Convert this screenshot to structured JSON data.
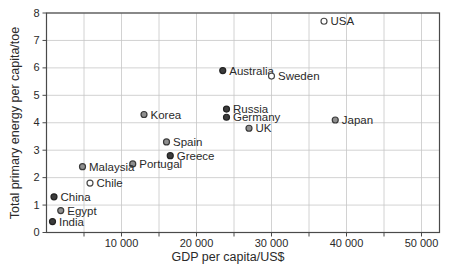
{
  "figure": {
    "background": "#ffffff",
    "plot_area": {
      "left": 46.5,
      "top": 13,
      "right": 439.5,
      "bottom": 232.5
    },
    "colors": {
      "grid": "#c6c6c6",
      "axis": "#4a4a4a",
      "text": "#2a2a2a"
    }
  },
  "chart_data": {
    "type": "scatter",
    "title": "",
    "xlabel": "GDP per capita/US$",
    "ylabel": "Total primary energy per capita/toe",
    "xlim": [
      0,
      52400
    ],
    "ylim": [
      0,
      8
    ],
    "grid": "on",
    "x_grid_step": 5000,
    "y_grid_step": 1,
    "x_ticks": [
      {
        "value": 10000,
        "label": "10 000"
      },
      {
        "value": 20000,
        "label": "20 000"
      },
      {
        "value": 30000,
        "label": "30 000"
      },
      {
        "value": 40000,
        "label": "40 000"
      },
      {
        "value": 50000,
        "label": "50 000"
      }
    ],
    "x_minor_ticks": [
      5000,
      15000,
      25000,
      35000,
      45000
    ],
    "y_ticks": [
      {
        "value": 0,
        "label": "0"
      },
      {
        "value": 1,
        "label": "1"
      },
      {
        "value": 2,
        "label": "2"
      },
      {
        "value": 3,
        "label": "3"
      },
      {
        "value": 4,
        "label": "4"
      },
      {
        "value": 5,
        "label": "5"
      },
      {
        "value": 6,
        "label": "6"
      },
      {
        "value": 7,
        "label": "7"
      },
      {
        "value": 8,
        "label": "8"
      }
    ],
    "marker_styles": {
      "open": {
        "fill": "#ffffff",
        "stroke": "#4a4a4a"
      },
      "gray": {
        "fill": "#8f8f8f",
        "stroke": "#3a3a3a"
      },
      "dark": {
        "fill": "#3c3c3c",
        "stroke": "#222222"
      }
    },
    "points": [
      {
        "country": "USA",
        "gdp": 37000,
        "energy": 7.7,
        "style": "open"
      },
      {
        "country": "Australia",
        "gdp": 23500,
        "energy": 5.9,
        "style": "dark"
      },
      {
        "country": "Sweden",
        "gdp": 30000,
        "energy": 5.7,
        "style": "open"
      },
      {
        "country": "Russia",
        "gdp": 24000,
        "energy": 4.5,
        "style": "dark"
      },
      {
        "country": "Korea",
        "gdp": 13000,
        "energy": 4.3,
        "style": "gray"
      },
      {
        "country": "Germany",
        "gdp": 24000,
        "energy": 4.2,
        "style": "dark"
      },
      {
        "country": "Japan",
        "gdp": 38500,
        "energy": 4.1,
        "style": "gray"
      },
      {
        "country": "UK",
        "gdp": 27000,
        "energy": 3.8,
        "style": "gray"
      },
      {
        "country": "Spain",
        "gdp": 16000,
        "energy": 3.3,
        "style": "gray"
      },
      {
        "country": "Greece",
        "gdp": 16500,
        "energy": 2.8,
        "style": "dark"
      },
      {
        "country": "Portugal",
        "gdp": 11500,
        "energy": 2.5,
        "style": "gray"
      },
      {
        "country": "Malaysia",
        "gdp": 4800,
        "energy": 2.4,
        "style": "gray"
      },
      {
        "country": "Chile",
        "gdp": 5800,
        "energy": 1.8,
        "style": "open"
      },
      {
        "country": "China",
        "gdp": 1000,
        "energy": 1.3,
        "style": "dark"
      },
      {
        "country": "Egypt",
        "gdp": 1900,
        "energy": 0.8,
        "style": "gray"
      },
      {
        "country": "India",
        "gdp": 800,
        "energy": 0.4,
        "style": "dark"
      }
    ]
  }
}
